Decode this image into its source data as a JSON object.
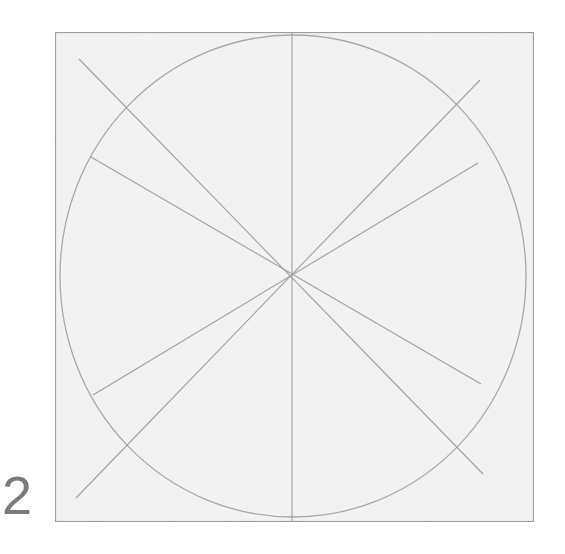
{
  "step": {
    "number": "2"
  },
  "drawing": {
    "description": "Circle inscribed in a square with eight guide lines radiating from the center",
    "frame": {
      "stroke": "#9a9a9a",
      "paper": "#f2f2f2"
    },
    "circle": {
      "stroke": "#a8a8a8"
    },
    "guide_lines": {
      "stroke": "#a0a0a0",
      "count": 8,
      "angles_deg": [
        90,
        -90,
        138,
        -42,
        152,
        -28,
        208,
        28,
        220,
        40,
        333,
        153
      ]
    }
  }
}
